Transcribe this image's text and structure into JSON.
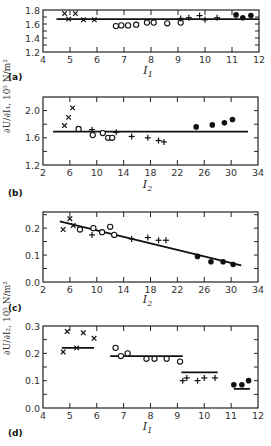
{
  "chart_data": [
    {
      "panel": "(a)",
      "type": "scatter",
      "xlabel": "I1",
      "ylabel": "∂U/∂I1, 10^5 N/m²",
      "xlim": [
        4,
        12
      ],
      "ylim": [
        1.2,
        1.8
      ],
      "xticks": [
        4,
        5,
        6,
        7,
        8,
        9,
        10,
        11,
        12
      ],
      "yticks": [
        1.2,
        1.4,
        1.6,
        1.8
      ],
      "series": [
        {
          "name": "x",
          "marker": "x",
          "points": [
            [
              4.8,
              1.75
            ],
            [
              4.95,
              1.67
            ],
            [
              5.2,
              1.75
            ],
            [
              5.5,
              1.66
            ],
            [
              5.9,
              1.66
            ]
          ]
        },
        {
          "name": "o",
          "marker": "o",
          "points": [
            [
              6.7,
              1.57
            ],
            [
              6.9,
              1.58
            ],
            [
              7.15,
              1.58
            ],
            [
              7.45,
              1.59
            ],
            [
              7.85,
              1.62
            ],
            [
              8.1,
              1.62
            ],
            [
              8.6,
              1.61
            ],
            [
              9.1,
              1.62
            ]
          ]
        },
        {
          "name": "+",
          "marker": "+",
          "points": [
            [
              9.1,
              1.68
            ],
            [
              9.4,
              1.69
            ],
            [
              9.8,
              1.72
            ],
            [
              10.0,
              1.66
            ],
            [
              10.45,
              1.69
            ]
          ]
        },
        {
          "name": "•",
          "marker": "filled",
          "points": [
            [
              11.15,
              1.73
            ],
            [
              11.4,
              1.69
            ],
            [
              11.7,
              1.72
            ]
          ]
        }
      ],
      "fit_line": {
        "type": "horizontal",
        "y": 1.67,
        "x": [
          4.5,
          12
        ]
      }
    },
    {
      "panel": "(b)",
      "type": "scatter",
      "xlabel": "I2",
      "ylabel": "∂U/∂I1, 10^5 N/m²",
      "xlim": [
        2,
        34
      ],
      "ylim": [
        1.2,
        2.2
      ],
      "xticks": [
        2,
        6,
        10,
        14,
        18,
        22,
        26,
        30,
        34
      ],
      "yticks": [
        1.2,
        1.6,
        2.0
      ],
      "series": [
        {
          "name": "x",
          "marker": "x",
          "points": [
            [
              5.2,
              1.78
            ],
            [
              5.8,
              1.9
            ],
            [
              6.4,
              2.04
            ]
          ]
        },
        {
          "name": "o",
          "marker": "o",
          "points": [
            [
              7.3,
              1.73
            ],
            [
              9.4,
              1.64
            ],
            [
              10.9,
              1.67
            ],
            [
              11.7,
              1.6
            ],
            [
              12.3,
              1.6
            ]
          ]
        },
        {
          "name": "+",
          "marker": "+",
          "points": [
            [
              9.3,
              1.72
            ],
            [
              12.9,
              1.68
            ],
            [
              15.2,
              1.62
            ],
            [
              17.6,
              1.6
            ],
            [
              19.2,
              1.56
            ],
            [
              20.0,
              1.54
            ]
          ]
        },
        {
          "name": "•",
          "marker": "filled",
          "points": [
            [
              24.8,
              1.76
            ],
            [
              27.2,
              1.79
            ],
            [
              29.0,
              1.82
            ],
            [
              30.2,
              1.87
            ]
          ]
        }
      ],
      "fit_line": {
        "type": "horizontal",
        "y": 1.69,
        "x": [
          3.5,
          32.5
        ]
      }
    },
    {
      "panel": "(c)",
      "type": "scatter",
      "xlabel": "I2",
      "ylabel": "∂U/∂I2, 10^5 N/m²",
      "xlim": [
        2,
        34
      ],
      "ylim": [
        0.0,
        0.26
      ],
      "xticks": [
        2,
        6,
        10,
        14,
        18,
        22,
        26,
        30,
        34
      ],
      "yticks": [
        0.0,
        0.1,
        0.2
      ],
      "series": [
        {
          "name": "x",
          "marker": "x",
          "points": [
            [
              5.0,
              0.195
            ],
            [
              6.0,
              0.235
            ],
            [
              6.5,
              0.21
            ]
          ]
        },
        {
          "name": "o",
          "marker": "o",
          "points": [
            [
              7.5,
              0.195
            ],
            [
              9.5,
              0.2
            ],
            [
              10.8,
              0.185
            ],
            [
              12.0,
              0.205
            ],
            [
              12.6,
              0.175
            ]
          ]
        },
        {
          "name": "+",
          "marker": "+",
          "points": [
            [
              9.3,
              0.175
            ],
            [
              15.2,
              0.16
            ],
            [
              17.6,
              0.165
            ],
            [
              19.2,
              0.155
            ],
            [
              20.3,
              0.155
            ]
          ]
        },
        {
          "name": "•",
          "marker": "filled",
          "points": [
            [
              25.0,
              0.095
            ],
            [
              27.0,
              0.075
            ],
            [
              28.8,
              0.075
            ],
            [
              30.3,
              0.065
            ]
          ]
        }
      ],
      "fit_line": {
        "type": "linear",
        "points": [
          [
            4.5,
            0.225
          ],
          [
            31.5,
            0.062
          ]
        ]
      }
    },
    {
      "panel": "(d)",
      "type": "scatter",
      "xlabel": "I1",
      "ylabel": "∂U/∂I2, 10^5 N/m²",
      "xlim": [
        4,
        12
      ],
      "ylim": [
        0.0,
        0.3
      ],
      "xticks": [
        4,
        5,
        6,
        7,
        8,
        9,
        10,
        11,
        12
      ],
      "yticks": [
        0.0,
        0.1,
        0.2,
        0.3
      ],
      "series": [
        {
          "name": "x",
          "marker": "x",
          "points": [
            [
              4.75,
              0.205
            ],
            [
              4.9,
              0.28
            ],
            [
              5.25,
              0.22
            ],
            [
              5.5,
              0.275
            ],
            [
              5.9,
              0.255
            ]
          ]
        },
        {
          "name": "o",
          "marker": "o",
          "points": [
            [
              6.7,
              0.22
            ],
            [
              6.9,
              0.19
            ],
            [
              7.15,
              0.2
            ],
            [
              7.85,
              0.18
            ],
            [
              8.15,
              0.18
            ],
            [
              8.6,
              0.18
            ],
            [
              9.1,
              0.17
            ]
          ]
        },
        {
          "name": "+",
          "marker": "+",
          "points": [
            [
              9.2,
              0.1
            ],
            [
              9.35,
              0.11
            ],
            [
              9.75,
              0.1
            ],
            [
              10.0,
              0.11
            ],
            [
              10.4,
              0.11
            ]
          ]
        },
        {
          "name": "•",
          "marker": "filled",
          "points": [
            [
              11.1,
              0.085
            ],
            [
              11.4,
              0.085
            ],
            [
              11.65,
              0.1
            ]
          ]
        }
      ],
      "fit_lines": [
        {
          "y": 0.22,
          "x": [
            4.7,
            5.9
          ]
        },
        {
          "y": 0.19,
          "x": [
            6.5,
            9.2
          ]
        },
        {
          "y": 0.13,
          "x": [
            9.15,
            10.5
          ]
        },
        {
          "y": 0.07,
          "x": [
            11.1,
            11.7
          ]
        }
      ]
    }
  ],
  "labels": {
    "panel_a": "(a)",
    "panel_b": "(b)",
    "panel_c": "(c)",
    "panel_d": "(d)",
    "xlabel_I1": "I",
    "xlabel_I2": "I",
    "sub_1": "1",
    "sub_2": "2",
    "ylabel_top": "∂U/∂I₁, 10⁵ N/m²",
    "ylabel_bottom": "∂U/∂I₂, 10⁵ N/m²"
  }
}
